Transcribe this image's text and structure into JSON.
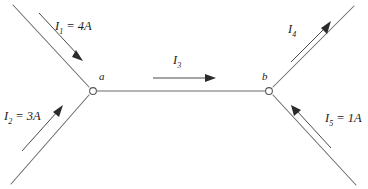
{
  "diagram": {
    "type": "circuit-junction",
    "stroke_color": "#6b6b6b",
    "arrow_color": "#2b2b2b",
    "background": "#ffffff",
    "nodes": [
      {
        "id": "a",
        "label": "a",
        "x": 92,
        "y": 91
      },
      {
        "id": "b",
        "label": "b",
        "x": 270,
        "y": 91
      }
    ],
    "branches": [
      {
        "id": "I1",
        "symbol": "I",
        "subscript": "1",
        "value": "4A",
        "label": "I₁ = 4A",
        "direction": "into-node-a",
        "position": "upper-left"
      },
      {
        "id": "I2",
        "symbol": "I",
        "subscript": "2",
        "value": "3A",
        "label": "I₂ = 3A",
        "direction": "into-node-a",
        "position": "lower-left"
      },
      {
        "id": "I3",
        "symbol": "I",
        "subscript": "3",
        "value": "",
        "label": "I₃",
        "direction": "a-to-b",
        "position": "center"
      },
      {
        "id": "I4",
        "symbol": "I",
        "subscript": "4",
        "value": "",
        "label": "I₄",
        "direction": "out-of-node-b",
        "position": "upper-right"
      },
      {
        "id": "I5",
        "symbol": "I",
        "subscript": "5",
        "value": "1A",
        "label": "I₅ = 1A",
        "direction": "into-node-b",
        "position": "lower-right"
      }
    ],
    "labels": {
      "i1_symbol": "I",
      "i1_sub": "1",
      "i1_eq": " = 4A",
      "i2_symbol": "I",
      "i2_sub": "2",
      "i2_eq": " = 3A",
      "i3_symbol": "I",
      "i3_sub": "3",
      "i3_eq": "",
      "i4_symbol": "I",
      "i4_sub": "4",
      "i4_eq": "",
      "i5_symbol": "I",
      "i5_sub": "5",
      "i5_eq": " = 1A",
      "node_a": "a",
      "node_b": "b"
    }
  }
}
